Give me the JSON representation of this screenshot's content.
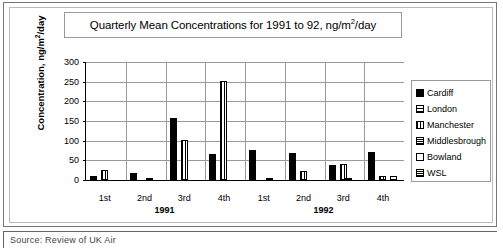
{
  "chart_data": {
    "type": "bar",
    "title": "Quarterly Mean Concentrations for 1991 to 92, ng/m2/day",
    "title_parts": {
      "before_sup": "Quarterly Mean Concentrations for 1991 to 92, ng/m",
      "sup": "2",
      "after_sup": "/day"
    },
    "xlabel": "",
    "ylabel": "Concentration, ng/m2/day",
    "ylabel_parts": {
      "before_sup": "Concentration, ng/m",
      "sup": "2",
      "after_sup": "/day"
    },
    "ylim": [
      0,
      300
    ],
    "yticks": [
      0,
      50,
      100,
      150,
      200,
      250,
      300
    ],
    "grid": true,
    "legend_position": "right",
    "categories": [
      "1st",
      "2nd",
      "3rd",
      "4th",
      "1st",
      "2nd",
      "3rd",
      "4th"
    ],
    "group_headers": [
      {
        "label": "1991",
        "span": [
          0,
          3
        ]
      },
      {
        "label": "1992",
        "span": [
          4,
          7
        ]
      }
    ],
    "series": [
      {
        "name": "Cardiff",
        "pattern": "solid",
        "values": [
          10,
          18,
          158,
          65,
          76,
          69,
          38,
          70
        ]
      },
      {
        "name": "London",
        "pattern": "horizontal-lines",
        "values": [
          0,
          0,
          0,
          0,
          0,
          0,
          0,
          0
        ]
      },
      {
        "name": "Manchester",
        "pattern": "vertical-lines",
        "values": [
          25,
          0,
          102,
          253,
          0,
          23,
          40,
          11
        ]
      },
      {
        "name": "Middlesbrough",
        "pattern": "dense-crosshatch",
        "values": [
          0,
          3,
          0,
          0,
          3,
          0,
          2,
          0
        ]
      },
      {
        "name": "Bowland",
        "pattern": "empty",
        "values": [
          0,
          0,
          0,
          0,
          0,
          0,
          0,
          11
        ]
      },
      {
        "name": "WSL",
        "pattern": "dense-crosshatch",
        "values": [
          0,
          0,
          0,
          0,
          0,
          0,
          0,
          0
        ]
      }
    ]
  },
  "legend": {
    "items": [
      {
        "label": "Cardiff"
      },
      {
        "label": "London"
      },
      {
        "label": "Manchester"
      },
      {
        "label": "Middlesbrough"
      },
      {
        "label": "Bowland"
      },
      {
        "label": "WSL"
      }
    ]
  },
  "caption": {
    "text": "Source: Review of UK Air"
  }
}
